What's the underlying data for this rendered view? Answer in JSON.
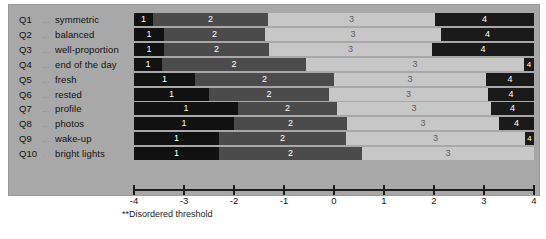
{
  "chart_data": {
    "type": "bar",
    "subtype": "stacked-horizontal-category-probability",
    "title": "",
    "xlabel": "",
    "ylabel": "",
    "xlim": [
      -4,
      4
    ],
    "grid": false,
    "legend": "none",
    "tick_labels": [
      "-4",
      "-3",
      "-2",
      "-1",
      "0",
      "1",
      "2",
      "3",
      "4"
    ],
    "tick_values": [
      -4,
      -3,
      -2,
      -1,
      0,
      1,
      2,
      3,
      4
    ],
    "footnote": "**Disordered threshold",
    "categories": [
      "1",
      "2",
      "3",
      "4"
    ],
    "category_colors": [
      "#111111",
      "#4b4b4b",
      "#c7c7c7",
      "#1a1a1a"
    ],
    "items": [
      {
        "id": "Q1",
        "dots": "...",
        "label": "symmetric",
        "boundaries": [
          -3.62,
          -1.32,
          2.02
        ],
        "segment_labels": [
          "1",
          "2",
          "3",
          "4"
        ]
      },
      {
        "id": "Q2",
        "dots": "...",
        "label": "balanced",
        "boundaries": [
          -3.4,
          -1.38,
          2.14
        ],
        "segment_labels": [
          "1",
          "2",
          "3",
          "4"
        ]
      },
      {
        "id": "Q3",
        "dots": "...",
        "label": "well-proportion",
        "boundaries": [
          -3.4,
          -1.3,
          1.96
        ],
        "segment_labels": [
          "1",
          "2",
          "3",
          "4"
        ]
      },
      {
        "id": "Q4",
        "dots": "...",
        "label": "end of the day",
        "boundaries": [
          -3.44,
          -0.56,
          3.8
        ],
        "segment_labels": [
          "1",
          "2",
          "3",
          "4"
        ]
      },
      {
        "id": "Q5",
        "dots": "...",
        "label": "fresh",
        "boundaries": [
          -2.78,
          0.0,
          3.04
        ],
        "segment_labels": [
          "1",
          "2",
          "3",
          "4"
        ]
      },
      {
        "id": "Q6",
        "dots": "...",
        "label": "rested",
        "boundaries": [
          -2.5,
          -0.1,
          3.08
        ],
        "segment_labels": [
          "1",
          "2",
          "3",
          "4"
        ]
      },
      {
        "id": "Q7",
        "dots": "...",
        "label": "profile",
        "boundaries": [
          -1.92,
          0.06,
          3.14
        ],
        "segment_labels": [
          "1",
          "2",
          "3",
          "4"
        ]
      },
      {
        "id": "Q8",
        "dots": "...",
        "label": "photos",
        "boundaries": [
          -2.0,
          0.26,
          3.3
        ],
        "segment_labels": [
          "1",
          "2",
          "3",
          "4"
        ]
      },
      {
        "id": "Q9",
        "dots": "...",
        "label": "wake-up",
        "boundaries": [
          -2.3,
          0.24,
          3.82
        ],
        "segment_labels": [
          "1",
          "2",
          "3",
          "4"
        ]
      },
      {
        "id": "Q10",
        "dots": ".",
        "label": "bright lights",
        "boundaries": [
          -2.3,
          0.56,
          4.0
        ],
        "segment_labels": [
          "1",
          "2",
          "3",
          "4"
        ]
      }
    ]
  }
}
